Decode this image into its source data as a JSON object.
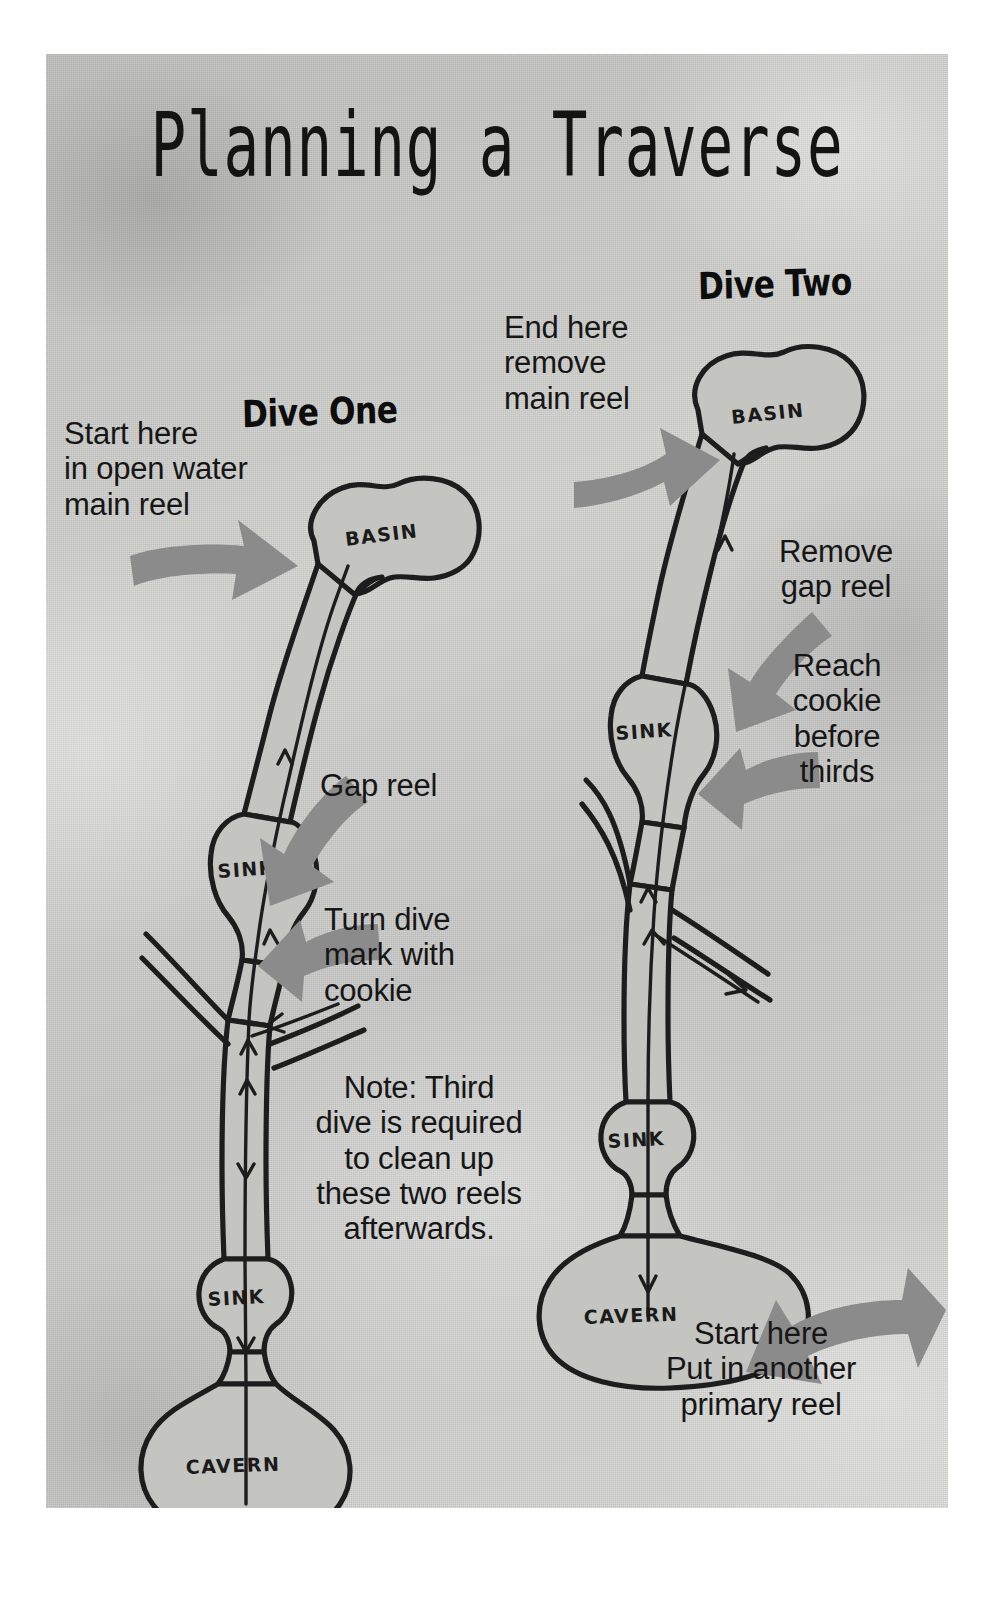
{
  "poster": {
    "title": "Planning a Traverse",
    "background_color": "#cbcbc8",
    "ink_color": "#1d1d1d",
    "arrow_color": "#8b8b8b"
  },
  "dive_one": {
    "heading": "Dive One",
    "start_note": "Start here\nin open water\nmain reel",
    "gap_reel_note": "Gap reel",
    "turn_note": "Turn dive\nmark with\ncookie",
    "cave_labels": {
      "basin": "BASIN",
      "sink_upper": "SINK",
      "sink_lower": "SINK",
      "cavern": "CAVERN"
    }
  },
  "dive_two": {
    "heading": "Dive Two",
    "end_note": "End here\nremove\nmain reel",
    "remove_gap_note": "Remove\ngap reel",
    "reach_cookie_note": "Reach\ncookie\nbefore\nthirds",
    "start_note": "Start here\nPut in another\nprimary reel",
    "cave_labels": {
      "basin": "BASIN",
      "sink_upper": "SINK",
      "sink_lower": "SINK",
      "cavern": "CAVERN"
    }
  },
  "note": {
    "text": "Note: Third\ndive is required\nto clean up\nthese two reels\nafterwards."
  }
}
